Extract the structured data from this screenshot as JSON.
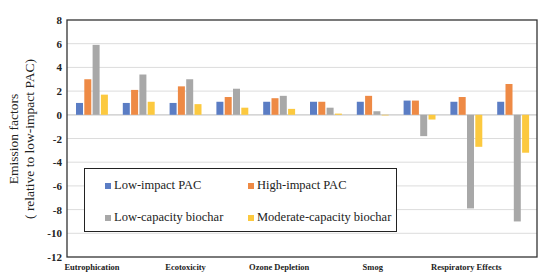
{
  "chart_data": {
    "type": "bar",
    "title": "",
    "xlabel": "",
    "ylabel": [
      "Emission factors",
      "( relative to low-impact PAC)"
    ],
    "ylim": [
      -12,
      8
    ],
    "yticks": [
      8,
      6,
      4,
      2,
      0,
      -2,
      -4,
      -6,
      -8,
      -10,
      -12
    ],
    "grid": true,
    "legend_position": "inside-lower-left",
    "categories": [
      "Eutrophication",
      "",
      "Ecotoxicity",
      "",
      "Ozone Depletion",
      "",
      "Smog",
      "",
      "Respiratory Effects",
      ""
    ],
    "series": [
      {
        "name": "Low-impact PAC",
        "color": "#5b7dc4",
        "values": [
          1.0,
          1.0,
          1.0,
          1.1,
          1.1,
          1.1,
          1.1,
          1.2,
          1.1,
          1.1
        ]
      },
      {
        "name": "High-impact PAC",
        "color": "#ee8a45",
        "values": [
          3.0,
          2.1,
          2.4,
          1.5,
          1.4,
          1.1,
          1.6,
          1.2,
          1.5,
          2.6
        ]
      },
      {
        "name": "Low-capacity biochar",
        "color": "#a8a8a8",
        "values": [
          5.9,
          3.4,
          3.0,
          2.2,
          1.6,
          0.6,
          0.3,
          -1.8,
          -7.9,
          -9.0
        ]
      },
      {
        "name": "Moderate-capacity biochar",
        "color": "#fcc93f",
        "values": [
          1.7,
          1.1,
          0.9,
          0.6,
          0.5,
          0.1,
          0.0,
          -0.4,
          -2.7,
          -3.2
        ]
      }
    ]
  },
  "legend": {
    "items": [
      {
        "label": "Low-impact PAC",
        "color": "#5b7dc4"
      },
      {
        "label": "High-impact PAC",
        "color": "#ee8a45"
      },
      {
        "label": "Low-capacity biochar",
        "color": "#a8a8a8"
      },
      {
        "label": "Moderate-capacity biochar",
        "color": "#fcc93f"
      }
    ]
  },
  "axis": {
    "ylabel_line1": "Emission factors",
    "ylabel_line2": "( relative to low-impact PAC)"
  }
}
